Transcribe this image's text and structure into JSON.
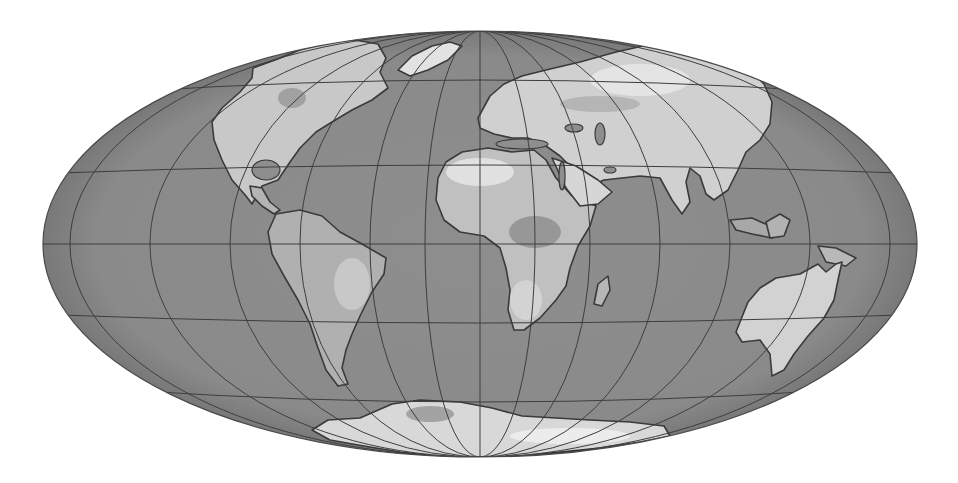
{
  "map": {
    "projection": "elliptical world projection (Hammer/Aitoff-like)",
    "width": 958,
    "height": 483,
    "ellipse": {
      "cx": 480,
      "cy": 244,
      "rx": 437,
      "ry": 213
    },
    "colors": {
      "background": "#ffffff",
      "ocean": "#8e8e8e",
      "ocean_edge": "#6a6a6a",
      "graticule": "#3e3e3e",
      "coast": "#3a3a3a",
      "land_low": "#a9a9a9",
      "land_mid": "#c4c4c4",
      "land_high": "#dedede",
      "land_peak": "#efefef",
      "land_dark": "#8a8a8a",
      "antarctic_shadow": "#2e2e2e"
    },
    "graticule": {
      "parallels": [
        {
          "name": "lat-60N",
          "cy": 80,
          "rx": 355,
          "ry": 12
        },
        {
          "name": "lat-30N",
          "cy": 165,
          "rx": 420,
          "ry": 8
        },
        {
          "name": "equator",
          "cy": 244,
          "rx": 437,
          "ry": 0
        },
        {
          "name": "lat-30S",
          "cy": 323,
          "rx": 420,
          "ry": 8
        },
        {
          "name": "lat-60S",
          "cy": 402,
          "rx": 355,
          "ry": 12
        }
      ],
      "meridian_rx": [
        0,
        55,
        110,
        180,
        250,
        330,
        410
      ]
    },
    "continents": [
      {
        "name": "north-america",
        "fill": "#c8c8c8",
        "path": "M253 68 L275 60 L300 50 L330 42 L355 40 L378 44 L386 58 L380 72 L388 88 L372 100 L352 110 L332 122 L316 132 L300 148 L290 162 L278 180 L262 186 L252 204 L246 196 L232 180 L222 160 L214 140 L212 122 L222 108 L240 92 L252 78 Z"
      },
      {
        "name": "greenland",
        "fill": "#e2e2e2",
        "path": "M398 70 L412 56 L432 46 L450 42 L462 46 L448 60 L428 70 L410 76 Z"
      },
      {
        "name": "central-america",
        "fill": "#b4b4b4",
        "path": "M250 186 L262 188 L270 202 L280 210 L274 214 L262 206 L252 196 Z"
      },
      {
        "name": "south-america",
        "fill": "#b0b0b0",
        "path": "M276 214 L300 210 L322 216 L340 232 L362 244 L386 258 L384 274 L372 292 L360 316 L352 334 L346 350 L342 368 L348 384 L338 386 L326 370 L318 348 L310 324 L298 300 L284 276 L272 254 L268 232 Z"
      },
      {
        "name": "africa",
        "fill": "#c0c0c0",
        "path": "M438 178 L446 162 L462 152 L488 148 L512 152 L534 150 L546 160 L556 178 L572 196 L596 206 L590 226 L578 246 L570 268 L566 286 L556 300 L540 318 L524 330 L514 330 L508 310 L510 290 L506 268 L500 248 L484 236 L460 232 L444 220 L436 200 Z"
      },
      {
        "name": "madagascar",
        "fill": "#b6b6b6",
        "path": "M598 284 L608 276 L610 290 L602 306 L594 304 Z"
      },
      {
        "name": "eurasia",
        "fill": "#d0d0d0",
        "path": "M478 118 L490 96 L504 84 L522 76 L546 70 L580 62 L616 52 L652 44 L690 44 L720 52 L746 66 L764 84 L772 102 L770 124 L760 140 L746 152 L738 170 L728 190 L714 200 L706 194 L700 176 L690 168 L686 182 L690 202 L682 214 L672 200 L660 178 L640 176 L622 178 L604 180 L590 186 L576 172 L560 156 L546 146 L528 138 L512 138 L494 134 L480 128 Z"
      },
      {
        "name": "arabia",
        "fill": "#d6d6d6",
        "path": "M552 158 L576 166 L598 180 L612 192 L598 204 L580 206 L566 188 Z"
      },
      {
        "name": "indonesia",
        "fill": "#a8a8a8",
        "path": "M730 220 L752 218 L770 226 L786 232 L772 238 L752 234 L736 230 Z"
      },
      {
        "name": "borneo",
        "fill": "#b2b2b2",
        "path": "M766 222 L780 214 L790 220 L784 236 L770 238 Z"
      },
      {
        "name": "new-guinea",
        "fill": "#b8b8b8",
        "path": "M818 246 L836 248 L856 258 L846 266 L826 262 Z"
      },
      {
        "name": "australia",
        "fill": "#d2d2d2",
        "path": "M748 302 L760 288 L776 278 L800 274 L818 264 L826 272 L836 264 L842 262 L838 280 L834 300 L824 318 L808 336 L794 354 L784 370 L772 376 L770 354 L760 340 L742 342 L736 332 Z"
      },
      {
        "name": "antarctica",
        "fill": "#d8d8d8",
        "path": "M312 430 L328 420 L360 418 L392 404 L420 400 L460 402 L492 408 L522 416 L556 418 L590 420 L630 422 L664 426 L670 436 L640 442 L600 448 L560 452 L520 456 L478 458 L436 456 L400 452 L364 446 L330 440 Z"
      }
    ],
    "relief_patches": [
      {
        "name": "hudson-bay",
        "fill": "#9a9a9a",
        "cx": 292,
        "cy": 98,
        "rx": 14,
        "ry": 10
      },
      {
        "name": "sahara-high",
        "fill": "#e6e6e6",
        "cx": 480,
        "cy": 172,
        "rx": 34,
        "ry": 14
      },
      {
        "name": "congo-basin",
        "fill": "#8f8f8f",
        "cx": 535,
        "cy": 232,
        "rx": 26,
        "ry": 16
      },
      {
        "name": "southern-africa",
        "fill": "#d6d6d6",
        "cx": 526,
        "cy": 300,
        "rx": 16,
        "ry": 20
      },
      {
        "name": "siberia-high",
        "fill": "#e8e8e8",
        "cx": 640,
        "cy": 80,
        "rx": 50,
        "ry": 16
      },
      {
        "name": "central-asia",
        "fill": "#b0b0b0",
        "cx": 600,
        "cy": 104,
        "rx": 40,
        "ry": 8
      },
      {
        "name": "brazil-highlands",
        "fill": "#cdcdcd",
        "cx": 352,
        "cy": 284,
        "rx": 18,
        "ry": 26
      },
      {
        "name": "antarctic-high",
        "fill": "#f0f0f0",
        "cx": 570,
        "cy": 436,
        "rx": 60,
        "ry": 8
      },
      {
        "name": "antarctic-low",
        "fill": "#9a9a9a",
        "cx": 430,
        "cy": 414,
        "rx": 24,
        "ry": 8
      }
    ],
    "lakes": [
      {
        "name": "caspian-sea",
        "cx": 600,
        "cy": 134,
        "rx": 5,
        "ry": 11
      },
      {
        "name": "black-sea",
        "cx": 574,
        "cy": 128,
        "rx": 9,
        "ry": 4
      },
      {
        "name": "mediterranean",
        "cx": 522,
        "cy": 144,
        "rx": 26,
        "ry": 5
      },
      {
        "name": "red-sea",
        "cx": 562,
        "cy": 176,
        "rx": 3,
        "ry": 14
      },
      {
        "name": "persian-gulf",
        "cx": 610,
        "cy": 170,
        "rx": 6,
        "ry": 3
      },
      {
        "name": "gulf-of-mexico",
        "cx": 266,
        "cy": 170,
        "rx": 14,
        "ry": 10
      }
    ]
  }
}
